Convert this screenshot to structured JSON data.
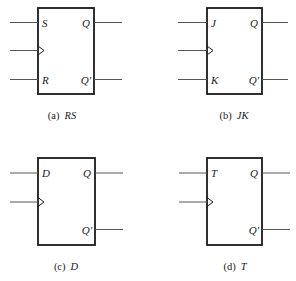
{
  "diagrams": [
    {
      "id": "rs",
      "caption_prefix": "(a)",
      "caption_name": "RS",
      "input_top": "S",
      "input_bottom": "R",
      "output_top": "Q",
      "output_bottom": "Q'"
    },
    {
      "id": "jk",
      "caption_prefix": "(b)",
      "caption_name": "JK",
      "input_top": "J",
      "input_bottom": "K",
      "output_top": "Q",
      "output_bottom": "Q'"
    },
    {
      "id": "d",
      "caption_prefix": "(c)",
      "caption_name": "D",
      "input_top": "D",
      "output_top": "Q",
      "output_bottom": "Q'"
    },
    {
      "id": "t",
      "caption_prefix": "(d)",
      "caption_name": "T",
      "input_top": "T",
      "output_top": "Q",
      "output_bottom": "Q'"
    }
  ],
  "colors": {
    "stroke": "#1a1a1a",
    "wire": "#555555"
  }
}
